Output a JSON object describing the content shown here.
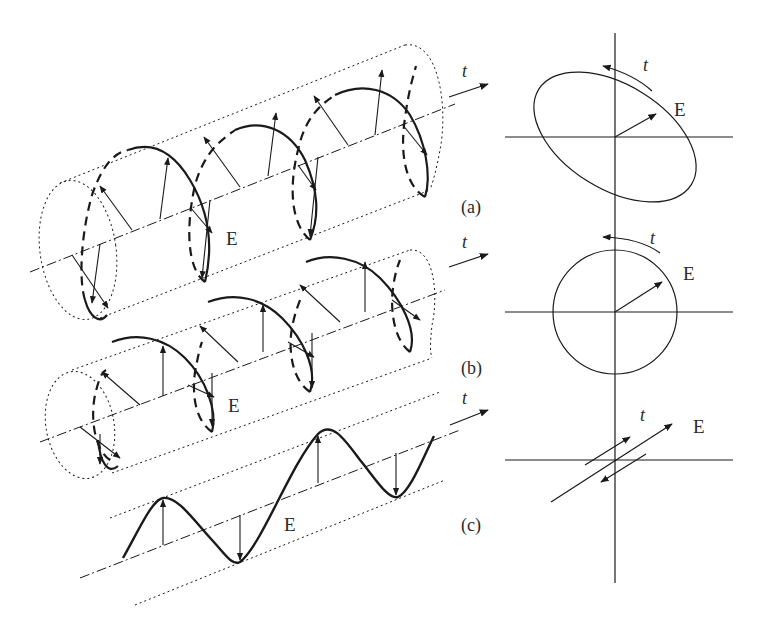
{
  "figure": {
    "panels": [
      {
        "id": "a",
        "label": "(a)",
        "name": "elliptical polarization",
        "vector_label": "E",
        "time_label": "t"
      },
      {
        "id": "b",
        "label": "(b)",
        "name": "circular polarization",
        "vector_label": "E",
        "time_label": "t"
      },
      {
        "id": "c",
        "label": "(c)",
        "name": "linear polarization",
        "vector_label": "E",
        "time_label": "t"
      }
    ],
    "end_views": [
      {
        "panel": "a",
        "shape": "ellipse tilted",
        "vector_label": "E",
        "time_label": "t"
      },
      {
        "panel": "b",
        "shape": "circle",
        "vector_label": "E",
        "time_label": "t"
      },
      {
        "panel": "c",
        "shape": "line segment",
        "vector_label": "E",
        "time_label": "t"
      }
    ]
  },
  "colors": {
    "ink": "#1a1a1a",
    "background": "#ffffff"
  }
}
